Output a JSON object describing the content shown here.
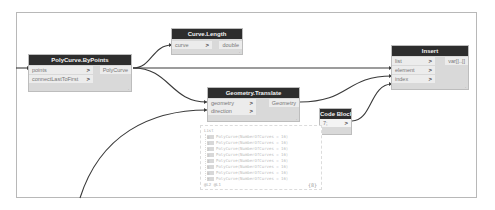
{
  "canvas": {
    "background": "#ffffff",
    "frame_border": "#b8b8b8",
    "wire_color": "#3a3a3a"
  },
  "nodes": {
    "polycurve_bypoints": {
      "title": "PolyCurve.ByPoints",
      "inputs": [
        {
          "label": "points",
          "chev": ">"
        },
        {
          "label": "connectLastToFirst",
          "chev": ">"
        }
      ],
      "output": "PolyCurve",
      "resize": "."
    },
    "curve_length": {
      "title": "Curve.Length",
      "inputs": [
        {
          "label": "curve",
          "chev": ">"
        }
      ],
      "output": "double",
      "resize": "."
    },
    "geometry_translate": {
      "title": "Geometry.Translate",
      "inputs": [
        {
          "label": "geometry",
          "chev": ">"
        },
        {
          "label": "direction",
          "chev": ">"
        }
      ],
      "output": "Geometry",
      "resize": "."
    },
    "code_block": {
      "title": "Code Block",
      "code": "7;",
      "chev": ">"
    },
    "insert": {
      "title": "Insert",
      "inputs": [
        {
          "label": "list",
          "chev": ">"
        },
        {
          "label": "element",
          "chev": ">"
        },
        {
          "label": "index",
          "chev": ">"
        }
      ],
      "output": "var[]..[]",
      "resize": "."
    }
  },
  "preview": {
    "header": "List",
    "items": [
      {
        "index": "0",
        "value": "PolyCurve(NumberOfCurves = 16)"
      },
      {
        "index": "1",
        "value": "PolyCurve(NumberOfCurves = 16)"
      },
      {
        "index": "2",
        "value": "PolyCurve(NumberOfCurves = 16)"
      },
      {
        "index": "3",
        "value": "PolyCurve(NumberOfCurves = 16)"
      },
      {
        "index": "4",
        "value": "PolyCurve(NumberOfCurves = 16)"
      },
      {
        "index": "5",
        "value": "PolyCurve(NumberOfCurves = 16)"
      },
      {
        "index": "6",
        "value": "PolyCurve(NumberOfCurves = 16)"
      },
      {
        "index": "7",
        "value": "PolyCurve(NumberOfCurves = 16)"
      }
    ],
    "count_label": "@L2 @L1",
    "pin_icon": "{8}"
  }
}
